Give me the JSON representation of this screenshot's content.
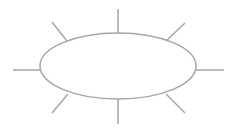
{
  "diagram": {
    "stroke_color": "#a6a6a6",
    "stroke_width": 1.5,
    "ellipse": {
      "cx": 118,
      "cy": 66,
      "rx": 78,
      "ry": 33
    },
    "rays": [
      {
        "name": "ray-top",
        "x1": 118,
        "y1": 9,
        "x2": 118,
        "y2": 33
      },
      {
        "name": "ray-bottom",
        "x1": 118,
        "y1": 99,
        "x2": 118,
        "y2": 124
      },
      {
        "name": "ray-left",
        "x1": 13,
        "y1": 70,
        "x2": 40,
        "y2": 70
      },
      {
        "name": "ray-right",
        "x1": 196,
        "y1": 70,
        "x2": 224,
        "y2": 70
      },
      {
        "name": "ray-top-left",
        "x1": 52,
        "y1": 22,
        "x2": 67,
        "y2": 41
      },
      {
        "name": "ray-top-right",
        "x1": 185,
        "y1": 23,
        "x2": 166,
        "y2": 41
      },
      {
        "name": "ray-bottom-left",
        "x1": 68,
        "y1": 94,
        "x2": 52,
        "y2": 113
      },
      {
        "name": "ray-bottom-right",
        "x1": 166,
        "y1": 94,
        "x2": 185,
        "y2": 113
      }
    ]
  }
}
